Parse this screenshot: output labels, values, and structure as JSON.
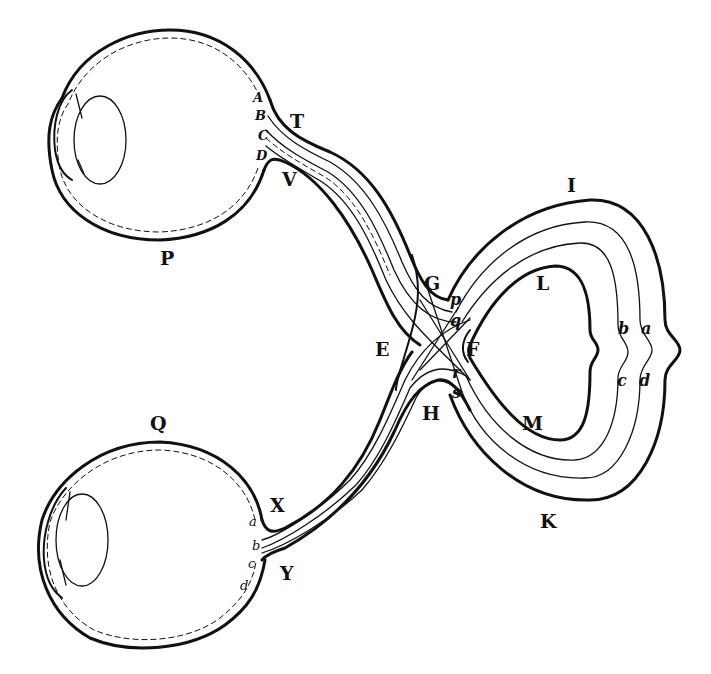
{
  "figure": {
    "labels": {
      "upper_eye": "P",
      "lower_eye": "Q",
      "upper_eye_retina_points": [
        "A",
        "B",
        "C",
        "D"
      ],
      "upper_nerve_top": "T",
      "upper_nerve_bottom": "V",
      "lower_nerve_top": "X",
      "lower_nerve_bottom": "Y",
      "lower_eye_retina_points": [
        "a",
        "b",
        "c",
        "d"
      ],
      "chiasma_left": "E",
      "chiasma_right": "F",
      "chiasma_top": "G",
      "chiasma_bottom": "H",
      "fibre_points": [
        "p",
        "q",
        "r",
        "s"
      ],
      "brain_top": "I",
      "brain_bottom": "K",
      "inner_top": "L",
      "inner_bottom": "M",
      "brain_layers": [
        "b",
        "a",
        "c",
        "d"
      ]
    }
  }
}
